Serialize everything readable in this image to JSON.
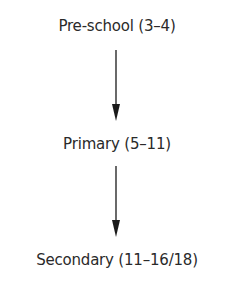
{
  "diagram": {
    "type": "vertical-flow",
    "nodes": [
      {
        "id": "preschool",
        "label": "Pre-school (3–4)"
      },
      {
        "id": "primary",
        "label": "Primary (5–11)"
      },
      {
        "id": "secondary",
        "label": "Secondary (11–16/18)"
      }
    ],
    "edges": [
      {
        "from": "preschool",
        "to": "primary"
      },
      {
        "from": "primary",
        "to": "secondary"
      }
    ],
    "colors": {
      "text": "#2a2a2a",
      "arrow": "#1a1a1a",
      "background": "#ffffff"
    }
  }
}
